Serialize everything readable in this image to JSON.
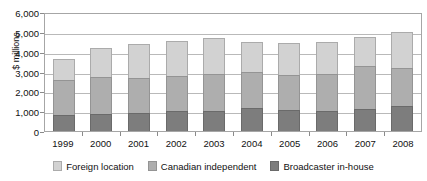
{
  "chart_data": {
    "type": "bar",
    "subtype": "stacked-vertical-bar",
    "title": "",
    "xlabel": "",
    "ylabel": "$ millions",
    "ylim": [
      0,
      6000
    ],
    "ytick_step": 1000,
    "ytick_labels": [
      "6,000",
      "5,000",
      "4,000",
      "3,000",
      "2,000",
      "1,000",
      "0"
    ],
    "ytick_values": [
      6000,
      5000,
      4000,
      3000,
      2000,
      1000,
      0
    ],
    "grid": true,
    "grid_axis": "y",
    "legend_position": "bottom-center",
    "categories": [
      "1999",
      "2000",
      "2001",
      "2002",
      "2003",
      "2004",
      "2005",
      "2006",
      "2007",
      "2008"
    ],
    "stack_order_bottom_to_top": [
      "Broadcaster in-house",
      "Canadian independent",
      "Foreign location"
    ],
    "series": [
      {
        "name": "Broadcaster in-house",
        "color": "#7d7d7d",
        "values": [
          800,
          850,
          900,
          1000,
          1000,
          1150,
          1050,
          1000,
          1100,
          1250
        ]
      },
      {
        "name": "Canadian independent",
        "color": "#aeaeae",
        "values": [
          1750,
          1850,
          1750,
          1750,
          1900,
          1850,
          1800,
          1850,
          2200,
          1950
        ]
      },
      {
        "name": "Foreign location",
        "color": "#d2d2d2",
        "values": [
          1100,
          1500,
          1750,
          1800,
          1800,
          1500,
          1600,
          1650,
          1450,
          1800
        ]
      }
    ],
    "totals": [
      3650,
      4200,
      4400,
      4550,
      4700,
      4500,
      4450,
      4500,
      4750,
      5000
    ]
  },
  "legend": {
    "items": [
      {
        "label": "Foreign location",
        "swatch": "s2"
      },
      {
        "label": "Canadian independent",
        "swatch": "s1"
      },
      {
        "label": "Broadcaster in-house",
        "swatch": "s0"
      }
    ]
  }
}
